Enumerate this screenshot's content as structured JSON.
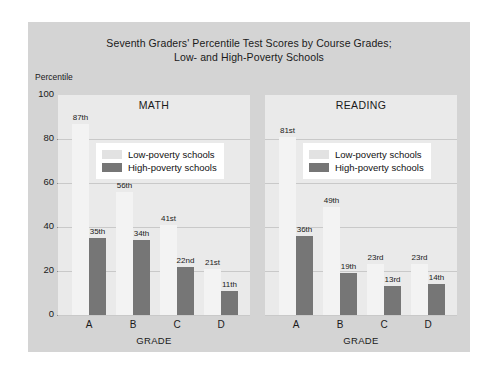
{
  "chart_data": {
    "type": "bar",
    "title": "Seventh Graders' Percentile Test Scores by Course Grades; Low- and High-Poverty Schools",
    "title_lines": [
      "Seventh Graders' Percentile Test Scores by Course Grades;",
      "Low- and High-Poverty Schools"
    ],
    "ylabel": "Percentile",
    "xlabel": "GRADE",
    "ylim": [
      0,
      100
    ],
    "yticks": [
      0,
      20,
      40,
      60,
      80,
      100
    ],
    "ytick_labels": [
      "0",
      "20",
      "40",
      "60",
      "80",
      "100"
    ],
    "grid": true,
    "legend_position": "inside-upper-center",
    "categories": [
      "A",
      "B",
      "C",
      "D"
    ],
    "series_names": [
      "Low-poverty schools",
      "High-poverty schools"
    ],
    "panels": [
      {
        "name": "MATH",
        "categories": [
          "A",
          "B",
          "C",
          "D"
        ],
        "series": [
          {
            "name": "Low-poverty schools",
            "values": [
              87,
              56,
              41,
              21
            ],
            "labels": [
              "87th",
              "56th",
              "41st",
              "21st"
            ]
          },
          {
            "name": "High-poverty schools",
            "values": [
              35,
              34,
              22,
              11
            ],
            "labels": [
              "35th",
              "34th",
              "22nd",
              "11th"
            ]
          }
        ]
      },
      {
        "name": "READING",
        "categories": [
          "A",
          "B",
          "C",
          "D"
        ],
        "series": [
          {
            "name": "Low-poverty schools",
            "values": [
              81,
              49,
              23,
              23
            ],
            "labels": [
              "81st",
              "49th",
              "23rd",
              "23rd"
            ]
          },
          {
            "name": "High-poverty schools",
            "values": [
              36,
              19,
              13,
              14
            ],
            "labels": [
              "36th",
              "19th",
              "13rd",
              "14th"
            ]
          }
        ]
      }
    ],
    "colors": {
      "low_poverty": "#f3f3f3",
      "high_poverty": "#767676",
      "figure_background": "#d4d4d4",
      "panel_background": "#eaeaea",
      "gridline": "#c9c9c9",
      "text": "#1a1a1a"
    }
  },
  "legend": {
    "low_label": "Low-poverty schools",
    "high_label": "High-poverty schools"
  }
}
